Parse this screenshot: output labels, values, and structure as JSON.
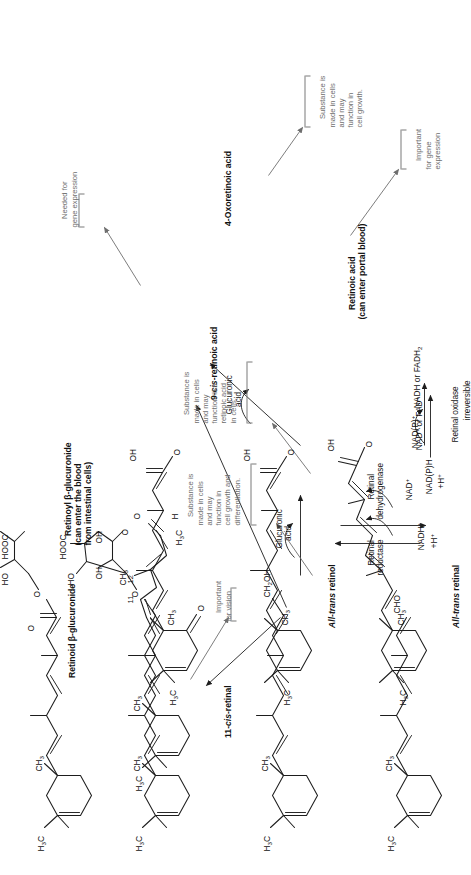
{
  "figure": {
    "orientation": "rotated-90-ccw",
    "ink_color": "#1d1d1d",
    "annotation_color": "#6e6e6e"
  },
  "compounds": [
    {
      "id": "all-trans-retinol",
      "label": "All-trans retinol",
      "italic_part": "trans"
    },
    {
      "id": "all-trans-retinal",
      "label": "All-trans retinal",
      "italic_part": "trans"
    },
    {
      "id": "11-cis-retinal",
      "label": "11-cis-retinal",
      "italic_part": "cis"
    },
    {
      "id": "9-cis-retinoic-acid",
      "label": "9-cis-retinoic acid",
      "italic_part": "cis"
    },
    {
      "id": "retinoic-acid",
      "label": "Retinoic acid\n(can enter portal blood)"
    },
    {
      "id": "4-oxoretinoic-acid",
      "label": "4-Oxoretinoic acid"
    },
    {
      "id": "retinoid-glucuronide",
      "label": "Retinoid β-glucuronide"
    },
    {
      "id": "retinoyl-glucuronide",
      "label": "Retinoyl β-glucuronide\n(can enter the blood\nfrom intestinal cells)"
    }
  ],
  "enzymes": [
    {
      "id": "retinal-reductase",
      "label": "Retinal\nreductase"
    },
    {
      "id": "retinal-dehydrogenase",
      "label": "Retinal\ndehydrogenase"
    },
    {
      "id": "retinal-oxidase",
      "label": "Retinal oxidase"
    }
  ],
  "cofactors": [
    {
      "id": "nadh-h-in",
      "label": "NADH⁺\n+H⁺"
    },
    {
      "id": "nad-plus-out",
      "label": "NAD⁺"
    },
    {
      "id": "nadp-plus-in",
      "label": "NAD(P)⁺"
    },
    {
      "id": "nadph-h-out",
      "label": "NAD(P)H\n+H⁺"
    },
    {
      "id": "nad-or-fad-in",
      "label": "NAD⁺ or FAD⁺"
    },
    {
      "id": "nadh-or-fadh2-out",
      "label": "NADH or FADH₂"
    }
  ],
  "reagents": [
    {
      "id": "glucuronic-acid-upper",
      "label": "Glucuronic\nacid"
    },
    {
      "id": "glucuronic-acid-lower",
      "label": "Glucuronic\nacid"
    }
  ],
  "reaction_notes": [
    {
      "id": "irreversible",
      "label": "irreversible"
    }
  ],
  "annotations": [
    {
      "id": "important-for-vision",
      "label": "Important\nfor vision",
      "target": "11-cis-retinal"
    },
    {
      "id": "needed-for-gene-expression",
      "label": "Needed for\ngene expression",
      "target": "9-cis-retinoic-acid"
    },
    {
      "id": "cell-growth-differentiation",
      "label": "Substance is\nmade in cells\nand may\nfunction in\ncell growth and\ndifferentiation.",
      "target": "retinoid-glucuronide"
    },
    {
      "id": "function-like-retinoic-acid",
      "label": "Substance is\nmade in cells\nand may\nfunction like\nretinoic acid\nin cells.",
      "target": "retinoyl-glucuronide"
    },
    {
      "id": "important-for-gene-expression",
      "label": "Important\nfor gene\nexpression",
      "target": "retinoic-acid"
    },
    {
      "id": "cell-growth",
      "label": "Substance is\nmade in cells\nand may\nfunction in\ncell growth.",
      "target": "4-oxoretinoic-acid"
    }
  ],
  "atom_labels": [
    {
      "id": "ch2oh-retinol",
      "html": "CH<sub>2</sub>OH"
    },
    {
      "id": "cho-retinal",
      "html": "CHO"
    },
    {
      "id": "h3c-ring-retinol",
      "html": "H<sub>3</sub>C"
    },
    {
      "id": "ch3-ring-retinol",
      "html": "CH<sub>3</sub>"
    },
    {
      "id": "h3c-ring-retinal",
      "html": "H<sub>3</sub>C"
    },
    {
      "id": "ch3-ring-retinal",
      "html": "CH<sub>3</sub>"
    },
    {
      "id": "h3c-cis-retinal",
      "html": "H<sub>3</sub>C"
    },
    {
      "id": "o-aldehyde",
      "html": "O"
    },
    {
      "id": "h-aldehyde",
      "html": "H"
    },
    {
      "id": "oh-acid",
      "html": "OH"
    },
    {
      "id": "o-acid",
      "html": "O"
    },
    {
      "id": "hooc-sugar",
      "html": "HOOC"
    },
    {
      "id": "ho-sugar",
      "html": "HO"
    },
    {
      "id": "oh-sugar",
      "html": "OH"
    },
    {
      "id": "o-ring-sugar",
      "html": "O"
    }
  ],
  "carbon_numbers": [
    {
      "id": "c11",
      "label": "11"
    },
    {
      "id": "c12",
      "label": "12"
    }
  ]
}
